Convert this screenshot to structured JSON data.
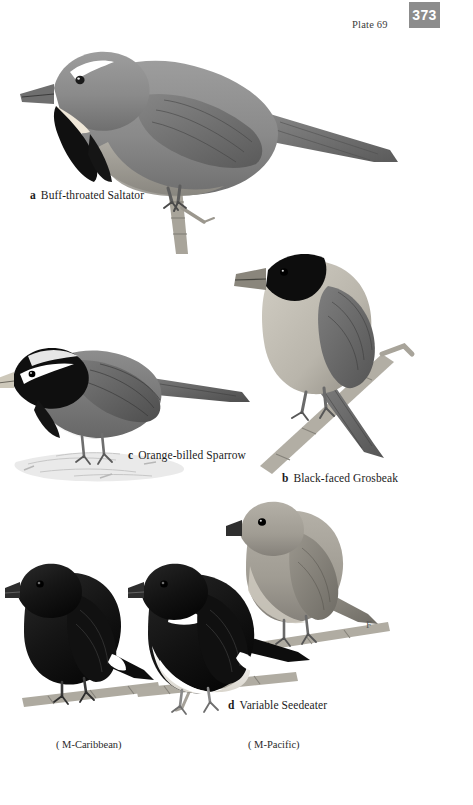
{
  "header": {
    "plate_label": "Plate 69",
    "page_number": "373",
    "page_box_color": "#8c8c8c"
  },
  "plate": {
    "background": "#ffffff",
    "medium": "grayscale-illustration",
    "width": 473,
    "height": 805
  },
  "species": [
    {
      "key": "a",
      "name": "Buff-throated Saltator",
      "caption": "Buff-throated Saltator",
      "position": "top",
      "perch": "vertical-stub-branch",
      "plumage": {
        "upperparts": "#8b8b8b",
        "underparts": "#9a9a9a",
        "throat": "#efe7d8",
        "mask": "#111111",
        "supercilium": "#ffffff",
        "bill": "#6d6d6d"
      }
    },
    {
      "key": "b",
      "name": "Black-faced Grosbeak",
      "caption": "Black-faced Grosbeak",
      "position": "middle-right",
      "perch": "diagonal-branch",
      "plumage": {
        "upperparts": "#8f8f8f",
        "underparts": "#c8c4ba",
        "face": "#0d0d0d",
        "bill": "#7e7a70",
        "wing": "#6f6f6f"
      }
    },
    {
      "key": "c",
      "name": "Orange-billed Sparrow",
      "caption": "Orange-billed Sparrow",
      "position": "middle-left",
      "perch": "leaf-litter-ground",
      "plumage": {
        "upperparts": "#7c7c7c",
        "underparts": "#ffffff",
        "head_stripes": "#0f0f0f",
        "crown_stripe": "#e8e8e8",
        "breast_band": "#141414",
        "bill": "#c9c4b6"
      }
    },
    {
      "key": "d",
      "name": "Variable Seedeater",
      "caption": "Variable Seedeater",
      "position": "bottom",
      "forms": [
        {
          "label": "( M-Caribbean)",
          "sex": "male",
          "race": "Caribbean",
          "plumage": {
            "body": "#141414",
            "wing_patch": "#ffffff",
            "bill": "#2a2a2a"
          }
        },
        {
          "label": "( M-Pacific)",
          "sex": "male",
          "race": "Pacific",
          "plumage": {
            "upperparts": "#141414",
            "underparts": "#f2f2f2",
            "collar": "#ffffff",
            "wing_patch": "#ffffff",
            "bill": "#2a2a2a"
          }
        },
        {
          "label": "F",
          "sex": "female",
          "race": "",
          "plumage": {
            "upperparts": "#a6a29a",
            "underparts": "#cfcabf",
            "bill": "#2f2f2f"
          }
        }
      ]
    }
  ],
  "annotations": {
    "female_mark": "F"
  }
}
